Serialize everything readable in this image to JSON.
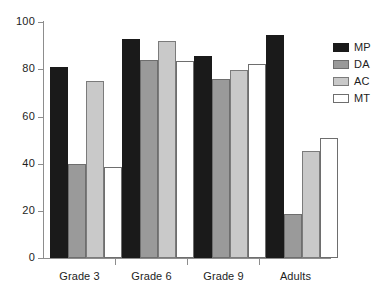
{
  "chart_data": {
    "type": "bar",
    "title": "",
    "xlabel": "",
    "ylabel": "",
    "categories": [
      "Grade 3",
      "Grade 6",
      "Grade 9",
      "Adults"
    ],
    "series": [
      {
        "name": "MP",
        "color": "#1a1a1a",
        "values": [
          81,
          93,
          85.5,
          94.5
        ]
      },
      {
        "name": "DA",
        "color": "#9a9a9a",
        "values": [
          40,
          84,
          76,
          18.5
        ]
      },
      {
        "name": "AC",
        "color": "#c9c9c9",
        "values": [
          75,
          92,
          79.5,
          45.5
        ]
      },
      {
        "name": "MT",
        "color": "#ffffff",
        "values": [
          38.5,
          83.5,
          82,
          51
        ]
      }
    ],
    "ylim": [
      0,
      100
    ],
    "yticks": [
      0,
      20,
      40,
      60,
      80,
      100
    ],
    "ytick_labels": [
      "0",
      "20",
      "40",
      "60",
      "80",
      "100"
    ],
    "grid": false,
    "legend_position": "right",
    "legend_entries": [
      "MP",
      "DA",
      "AC",
      "MT"
    ]
  },
  "axis": {
    "y_labels": [
      "100",
      "80",
      "60",
      "40",
      "20",
      "0"
    ],
    "x_labels": [
      "Grade 3",
      "Grade 6",
      "Grade 9",
      "Adults"
    ]
  },
  "legend": {
    "items": [
      {
        "label": "MP",
        "swatch": "black-filled-swatch"
      },
      {
        "label": "DA",
        "swatch": "dark-gray-swatch"
      },
      {
        "label": "AC",
        "swatch": "light-gray-swatch"
      },
      {
        "label": "MT",
        "swatch": "white-swatch"
      }
    ]
  }
}
